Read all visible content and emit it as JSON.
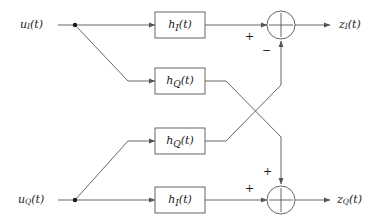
{
  "diagram": {
    "background_color": "#ffffff",
    "line_color": "#555555",
    "text_color": "#1a1a1a",
    "inputs": [
      {
        "id": "u_I",
        "base": "u",
        "sub": "I",
        "arg": "(t)",
        "text": "u_I(t)"
      },
      {
        "id": "u_Q",
        "base": "u",
        "sub": "Q",
        "arg": "(t)",
        "text": "u_Q(t)"
      }
    ],
    "outputs": [
      {
        "id": "z_I",
        "base": "z",
        "sub": "I",
        "arg": "(t)",
        "text": "z_I(t)"
      },
      {
        "id": "z_Q",
        "base": "z",
        "sub": "Q",
        "arg": "(t)",
        "text": "z_Q(t)"
      }
    ],
    "blocks": [
      {
        "id": "block-hi-top",
        "base": "h",
        "sub": "I",
        "arg": "(t)",
        "text": "h_I(t)"
      },
      {
        "id": "block-hq-upper",
        "base": "h",
        "sub": "Q",
        "arg": "(t)",
        "text": "h_Q(t)"
      },
      {
        "id": "block-hq-lower",
        "base": "h",
        "sub": "Q",
        "arg": "(t)",
        "text": "h_Q(t)"
      },
      {
        "id": "block-hi-bottom",
        "base": "h",
        "sub": "I",
        "arg": "(t)",
        "text": "h_I(t)"
      }
    ],
    "summers": [
      {
        "id": "summer-top",
        "signs": [
          {
            "id": "sign-top-left",
            "text": "+"
          },
          {
            "id": "sign-top-bottom",
            "text": "−"
          }
        ]
      },
      {
        "id": "summer-bottom",
        "signs": [
          {
            "id": "sign-bottom-top",
            "text": "+"
          },
          {
            "id": "sign-bottom-left",
            "text": "+"
          }
        ]
      }
    ]
  }
}
